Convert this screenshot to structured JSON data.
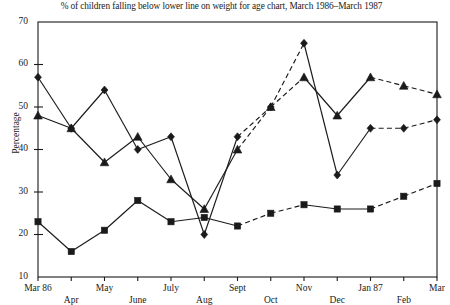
{
  "chart_data": {
    "type": "line",
    "title": "% of children falling below lower line on weight for age chart, March 1986–March 1987",
    "xlabel": "",
    "ylabel": "Percentage",
    "categories": [
      "Mar 86",
      "Apr",
      "May",
      "June",
      "July",
      "Aug",
      "Sept",
      "Oct",
      "Nov",
      "Dec",
      "Jan 87",
      "Feb",
      "Mar"
    ],
    "ylim": [
      10,
      70
    ],
    "yticks": [
      10,
      20,
      30,
      40,
      50,
      60,
      70
    ],
    "ytick_labels": [
      "10",
      "20",
      "30",
      "40",
      "50",
      "60",
      "70"
    ],
    "grid": false,
    "legend": "none",
    "series": [
      {
        "name": "series-diamond",
        "marker": "diamond",
        "values": [
          57,
          45,
          54,
          40,
          43,
          20,
          43,
          50,
          65,
          34,
          45,
          45,
          47
        ],
        "segment_styles": [
          "solid",
          "solid",
          "solid",
          "solid",
          "solid",
          "solid",
          "dashed",
          "dashed",
          "solid",
          "solid",
          "dashed",
          "dashed"
        ]
      },
      {
        "name": "series-triangle",
        "marker": "triangle",
        "values": [
          48,
          45,
          37,
          43,
          33,
          26,
          40,
          50,
          57,
          48,
          57,
          55,
          53
        ],
        "segment_styles": [
          "solid",
          "solid",
          "solid",
          "solid",
          "solid",
          "solid",
          "dashed",
          "dashed",
          "solid",
          "solid",
          "dashed",
          "dashed"
        ]
      },
      {
        "name": "series-square",
        "marker": "square",
        "values": [
          23,
          16,
          21,
          28,
          23,
          24,
          22,
          25,
          27,
          26,
          26,
          29,
          32
        ],
        "segment_styles": [
          "solid",
          "solid",
          "solid",
          "solid",
          "solid",
          "solid",
          "dashed",
          "dashed",
          "solid",
          "solid",
          "dashed",
          "dashed"
        ]
      }
    ],
    "colors": {
      "axis": "#1a1a1a",
      "series_diamond": "#1a1a1a",
      "series_triangle": "#1a1a1a",
      "series_square": "#1a1a1a",
      "background": "#ffffff"
    }
  },
  "xtick_rows": [
    0,
    1,
    0,
    1,
    0,
    1,
    0,
    1,
    0,
    1,
    0,
    1,
    0
  ]
}
